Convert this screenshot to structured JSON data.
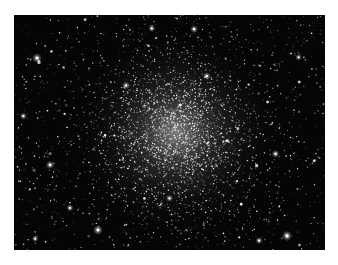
{
  "page": {
    "background_color": "#ffffff",
    "width": 338,
    "height": 265
  },
  "photo": {
    "subject": "globular-star-cluster",
    "background_color": "#050505",
    "star_color": "#ffffff",
    "glow_color_core": "rgba(212,212,216,0.55)",
    "glow_color_mid": "rgba(150,150,158,0.26)",
    "glow_color_outer": "rgba(80,80,88,0.10)",
    "frame": {
      "left": 14,
      "top": 15,
      "width": 311,
      "height": 235
    },
    "seed": 1987,
    "noise_star_count": 700,
    "field_star_count": 850,
    "cluster": {
      "center_x_frac": 0.52,
      "center_y_frac": 0.5,
      "glow_radius_frac": 0.34,
      "core_sigma_frac": 0.1,
      "core_star_count": 1700,
      "halo_sigma_frac": 0.2,
      "halo_star_count": 1400
    },
    "bright_stars": [
      {
        "x": 0.074,
        "y": 0.183,
        "r": 1.5
      },
      {
        "x": 0.443,
        "y": 0.057,
        "r": 1.1
      },
      {
        "x": 0.579,
        "y": 0.06,
        "r": 1.2
      },
      {
        "x": 0.116,
        "y": 0.638,
        "r": 1.3
      },
      {
        "x": 0.27,
        "y": 0.915,
        "r": 1.5
      },
      {
        "x": 0.18,
        "y": 0.821,
        "r": 1.1
      },
      {
        "x": 0.841,
        "y": 0.591,
        "r": 1.2
      },
      {
        "x": 0.878,
        "y": 0.94,
        "r": 1.6
      },
      {
        "x": 0.788,
        "y": 0.96,
        "r": 1.1
      },
      {
        "x": 0.915,
        "y": 0.18,
        "r": 1.0
      },
      {
        "x": 0.03,
        "y": 0.43,
        "r": 1.1
      },
      {
        "x": 0.36,
        "y": 0.3,
        "r": 1.2
      },
      {
        "x": 0.62,
        "y": 0.26,
        "r": 1.2
      },
      {
        "x": 0.5,
        "y": 0.78,
        "r": 1.1
      },
      {
        "x": 0.068,
        "y": 0.952,
        "r": 1.0
      }
    ]
  }
}
